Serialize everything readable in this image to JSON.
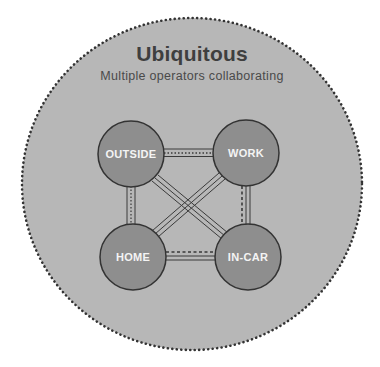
{
  "header": {
    "title": "Ubiquitous",
    "subtitle": "Multiple operators collaborating"
  },
  "colors": {
    "background": "#ffffff",
    "outer_circle_fill": "#b7b7b7",
    "outer_circle_dots": "#333333",
    "node_fill": "#8e8e8e",
    "node_stroke": "#333333",
    "node_text": "#f4f4f4",
    "connector": "#3a3a3a"
  },
  "nodes": [
    {
      "id": "outside",
      "label": "OUTSIDE"
    },
    {
      "id": "work",
      "label": "WORK"
    },
    {
      "id": "home",
      "label": "HOME"
    },
    {
      "id": "in-car",
      "label": "IN-CAR"
    }
  ],
  "connections": [
    {
      "from": "OUTSIDE",
      "to": "WORK"
    },
    {
      "from": "OUTSIDE",
      "to": "HOME"
    },
    {
      "from": "WORK",
      "to": "IN-CAR"
    },
    {
      "from": "HOME",
      "to": "IN-CAR"
    },
    {
      "from": "OUTSIDE",
      "to": "IN-CAR"
    },
    {
      "from": "WORK",
      "to": "HOME"
    }
  ]
}
